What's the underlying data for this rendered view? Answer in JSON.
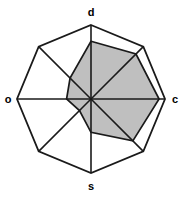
{
  "chart_data": {
    "type": "radar",
    "title": "",
    "xlabel": "",
    "ylabel": "",
    "grid": false,
    "legend": "none",
    "axis_count": 8,
    "rmax": 1.0,
    "rlim": [
      0,
      1
    ],
    "categories": [
      "d",
      "dc",
      "c",
      "sc",
      "s",
      "so",
      "o",
      "do"
    ],
    "labeled_categories": [
      "d",
      "c",
      "s",
      "o"
    ],
    "axis_angles_deg": [
      90,
      45,
      0,
      315,
      270,
      225,
      180,
      135
    ],
    "series": [
      {
        "name": "data",
        "values": [
          0.78,
          0.86,
          0.92,
          0.8,
          0.45,
          0.22,
          0.33,
          0.4
        ],
        "fill": "#bfbfbf",
        "stroke": "#1a1a1a"
      },
      {
        "name": "reference-outline",
        "values": [
          1.0,
          1.0,
          1.0,
          1.0,
          1.0,
          1.0,
          1.0,
          1.0
        ],
        "fill": "none",
        "stroke": "#1a1a1a"
      }
    ]
  },
  "labels": {
    "north": "d",
    "east": "c",
    "south": "s",
    "west": "o"
  },
  "colors": {
    "fill": "#bfbfbf",
    "stroke": "#1a1a1a",
    "background": "#ffffff"
  }
}
